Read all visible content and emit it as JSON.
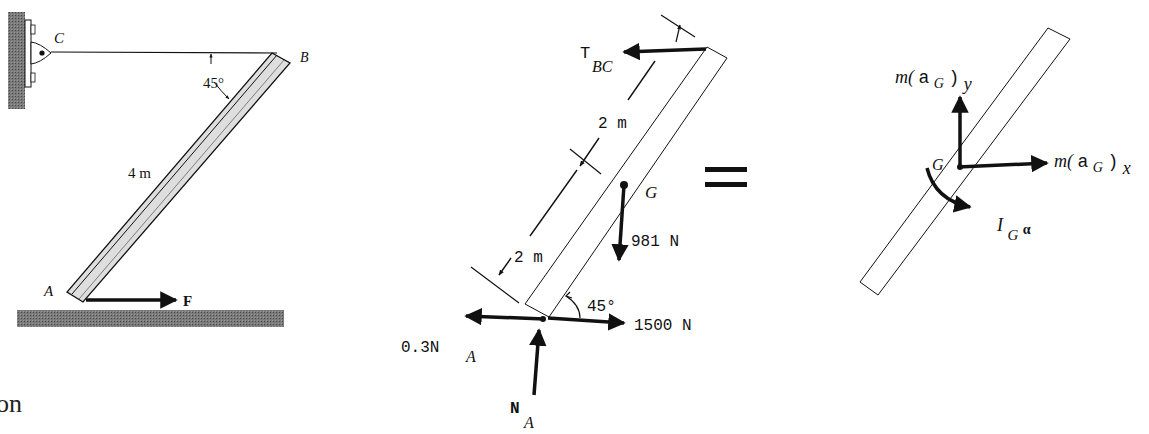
{
  "figure_left": {
    "support_label": "C",
    "end_label_top": "B",
    "end_label_bottom": "A",
    "angle_label": "45°",
    "length_label": "4 m",
    "force_label": "F",
    "caption_fragment": "on"
  },
  "fbd": {
    "tension_label_main": "T",
    "tension_label_sub": "BC",
    "dim_upper": "2 m",
    "dim_lower": "2 m",
    "center_label": "G",
    "weight_label": "981 N",
    "angle_label": "45°",
    "applied_force_label": "1500 N",
    "friction_label_main": "0.3N",
    "friction_label_sub": "A",
    "normal_label_main": "N",
    "normal_label_sub": "A"
  },
  "equals_sign": "=",
  "kinetic": {
    "center_label": "G",
    "may_prefix": "m(",
    "may_a": "a",
    "may_sub": "G",
    "may_suffix": ")",
    "may_axis": "y",
    "max_prefix": "m(",
    "max_a": "a",
    "max_sub": "G",
    "max_suffix": ")",
    "max_axis": "x",
    "moment_main": "I",
    "moment_sub": "G",
    "moment_alpha": "α"
  },
  "colors": {
    "ink": "#111111",
    "hatch": "#6b6b6b",
    "bar_fill": "#e2e2e2"
  }
}
